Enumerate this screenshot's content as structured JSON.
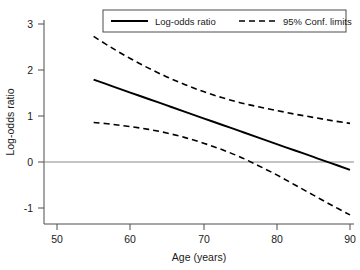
{
  "chart_data": {
    "type": "line",
    "title": "",
    "xlabel": "Age (years)",
    "ylabel": "Log-odds ratio",
    "xlim": [
      48,
      92
    ],
    "ylim": [
      -1.45,
      3.25
    ],
    "xticks": [
      50,
      60,
      70,
      80,
      90
    ],
    "xtick_labels": [
      "50",
      "60",
      "70",
      "80",
      "90"
    ],
    "yticks": [
      -1,
      0,
      1,
      2,
      3
    ],
    "ytick_labels": [
      "-1",
      "0",
      "1",
      "2",
      "3"
    ],
    "grid": false,
    "legend_position": "top-center",
    "reference_lines": [
      {
        "name": "zero-line",
        "axis": "y",
        "value": 0
      }
    ],
    "x": [
      55,
      57.5,
      60,
      62.5,
      65,
      67.5,
      70,
      72.5,
      75,
      77.5,
      80,
      82.5,
      85,
      87.5,
      90
    ],
    "series": [
      {
        "name": "Log-odds ratio",
        "style": "solid",
        "color": "#000000",
        "values": [
          1.79,
          1.65,
          1.51,
          1.37,
          1.23,
          1.09,
          0.95,
          0.81,
          0.67,
          0.53,
          0.39,
          0.25,
          0.11,
          -0.03,
          -0.17
        ]
      },
      {
        "name": "95% Conf. limits upper",
        "style": "dashed",
        "color": "#000000",
        "values": [
          2.73,
          2.48,
          2.25,
          2.04,
          1.85,
          1.68,
          1.53,
          1.4,
          1.29,
          1.2,
          1.12,
          1.04,
          0.97,
          0.9,
          0.84
        ]
      },
      {
        "name": "95% Conf. limits lower",
        "style": "dashed",
        "color": "#000000",
        "values": [
          0.86,
          0.82,
          0.77,
          0.71,
          0.63,
          0.53,
          0.41,
          0.27,
          0.11,
          -0.08,
          -0.28,
          -0.5,
          -0.72,
          -0.94,
          -1.15
        ]
      }
    ],
    "annotations": []
  },
  "legend": {
    "entries": [
      {
        "label": "Log-odds ratio",
        "style": "solid"
      },
      {
        "label": "95% Conf. limits",
        "style": "dashed"
      }
    ]
  }
}
